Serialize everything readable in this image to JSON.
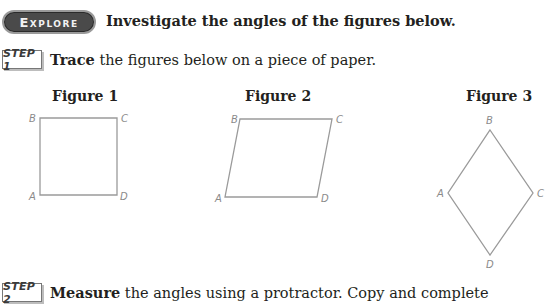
{
  "explore": {
    "badge": "Explore",
    "heading": "Investigate the angles of the figures below."
  },
  "steps": [
    {
      "badge": "STEP 1",
      "keyword": "Trace",
      "text": " the figures below on a piece of paper."
    },
    {
      "badge": "STEP 2",
      "keyword": "Measure",
      "text": " the angles using a protractor. Copy and complete"
    }
  ],
  "figures": [
    {
      "title": "Figure 1",
      "shape": "square",
      "vertices": {
        "A": [
          40,
          195
        ],
        "B": [
          40,
          118
        ],
        "C": [
          117,
          118
        ],
        "D": [
          117,
          195
        ]
      }
    },
    {
      "title": "Figure 2",
      "shape": "parallelogram",
      "vertices": {
        "A": [
          225,
          197
        ],
        "B": [
          240,
          119
        ],
        "C": [
          332,
          119
        ],
        "D": [
          317,
          197
        ]
      }
    },
    {
      "title": "Figure 3",
      "shape": "rhombus",
      "vertices": {
        "A": [
          448,
          193
        ],
        "B": [
          490,
          130
        ],
        "C": [
          533,
          193
        ],
        "D": [
          490,
          255
        ]
      }
    }
  ],
  "colors": {
    "line": "#9a9a9a",
    "label": "#8a8a8a",
    "badge_bg": "#4a4a4a"
  }
}
